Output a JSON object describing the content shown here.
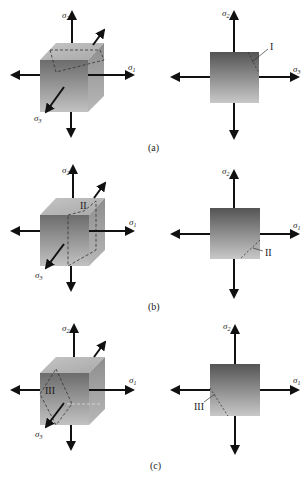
{
  "figure": {
    "panels": [
      {
        "caption": "(a)",
        "plane_label": "I",
        "cube_labels": {
          "top": "σ2",
          "right": "σ1",
          "front": "σ3"
        },
        "square_labels": {
          "top": "σ2",
          "right": "σ3"
        }
      },
      {
        "caption": "(b)",
        "plane_label": "II",
        "cube_labels": {
          "top": "σ2",
          "right": "σ1",
          "front": "σ3"
        },
        "square_labels": {
          "top": "σ2",
          "right": "σ1"
        }
      },
      {
        "caption": "(c)",
        "plane_label": "III",
        "cube_labels": {
          "top": "σ2",
          "right": "σ1",
          "front": "σ3"
        },
        "square_labels": {
          "top": "σ2",
          "right": "σ1"
        }
      }
    ],
    "colors": {
      "arrow": "#111111",
      "cube_front_top": "#6e6e6e",
      "cube_front_bottom": "#bdbdbd",
      "cube_top_face": "#b5b5b5",
      "cube_side_face": "#9a9a9a",
      "square_top": "#5a5a5a",
      "square_bottom": "#c4c4c4",
      "dashed": "#333333"
    }
  }
}
